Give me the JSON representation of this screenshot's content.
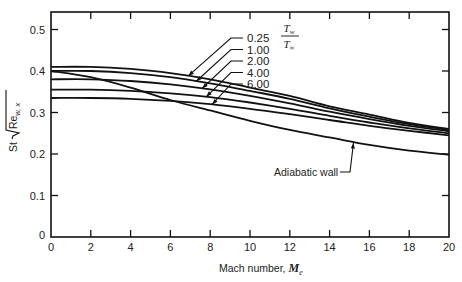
{
  "chart_data": {
    "type": "line",
    "title": "",
    "xlabel": "Mach number, ",
    "xlabel_symbol": "M",
    "xlabel_subscript": "e",
    "ylabel_prefix": "St",
    "ylabel_radicand": "Re",
    "ylabel_subscript": "w, x",
    "xlim": [
      0,
      20
    ],
    "ylim": [
      0,
      0.55
    ],
    "x_ticks": [
      0,
      2,
      4,
      6,
      8,
      10,
      12,
      14,
      16,
      18,
      20
    ],
    "x_tick_labels": [
      "0",
      "2",
      "4",
      "6",
      "8",
      "10",
      "12",
      "14",
      "16",
      "18",
      "20"
    ],
    "y_ticks": [
      0,
      0.1,
      0.2,
      0.3,
      0.4,
      0.5
    ],
    "y_tick_labels": [
      "0",
      "0.1",
      "0.2",
      "0.3",
      "0.4",
      "0.5"
    ],
    "grid": false,
    "legend": {
      "title_numerator": "T",
      "title_numerator_sub": "w",
      "title_denominator": "T",
      "title_denominator_sub": "∞",
      "placement": "top-center"
    },
    "x": [
      0,
      2,
      4,
      6,
      8,
      10,
      12,
      14,
      16,
      18,
      20
    ],
    "series": [
      {
        "name": "0.25",
        "values": [
          0.41,
          0.41,
          0.405,
          0.395,
          0.38,
          0.36,
          0.34,
          0.315,
          0.295,
          0.275,
          0.26
        ]
      },
      {
        "name": "1.00",
        "values": [
          0.4,
          0.4,
          0.395,
          0.385,
          0.37,
          0.352,
          0.333,
          0.31,
          0.29,
          0.272,
          0.258
        ]
      },
      {
        "name": "2.00",
        "values": [
          0.38,
          0.38,
          0.376,
          0.368,
          0.356,
          0.34,
          0.322,
          0.302,
          0.284,
          0.268,
          0.255
        ]
      },
      {
        "name": "4.00",
        "values": [
          0.355,
          0.355,
          0.352,
          0.346,
          0.337,
          0.324,
          0.309,
          0.292,
          0.276,
          0.262,
          0.25
        ]
      },
      {
        "name": "6.00",
        "values": [
          0.335,
          0.335,
          0.333,
          0.328,
          0.32,
          0.309,
          0.296,
          0.282,
          0.268,
          0.256,
          0.245
        ]
      },
      {
        "name": "Adiabatic wall",
        "values": [
          0.4,
          0.385,
          0.36,
          0.33,
          0.305,
          0.28,
          0.258,
          0.24,
          0.222,
          0.208,
          0.198
        ]
      }
    ],
    "annotations": [
      {
        "text": "Adiabatic wall",
        "target_series": "Adiabatic wall",
        "at_x": 15.2
      }
    ],
    "legend_arrow_x": [
      6.9,
      7.3,
      7.6,
      7.8,
      8.1
    ]
  }
}
